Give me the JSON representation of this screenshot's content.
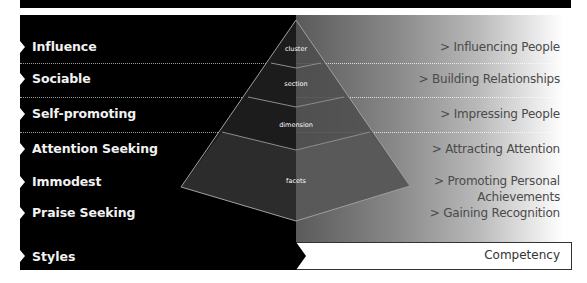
{
  "diagram": {
    "title_bar": "",
    "styles_header": "Styles",
    "competency_header": "Competency",
    "styles": [
      {
        "label": "Influence"
      },
      {
        "label": "Sociable"
      },
      {
        "label": "Self-promoting"
      },
      {
        "label": "Attention Seeking"
      },
      {
        "label": "Immodest"
      },
      {
        "label": "Praise Seeking"
      }
    ],
    "competencies": [
      {
        "line1": "> Influencing People",
        "line2": ""
      },
      {
        "line1": "> Building Relationships",
        "line2": ""
      },
      {
        "line1": "> Impressing People",
        "line2": ""
      },
      {
        "line1": "> Attracting Attention",
        "line2": ""
      },
      {
        "line1": "> Promoting Personal",
        "line2": "Achievements"
      },
      {
        "line1": "> Gaining Recognition",
        "line2": ""
      }
    ],
    "pyramid_levels": [
      "cluster",
      "section",
      "dimension",
      "facets"
    ],
    "colors": {
      "left_panel": "#000000",
      "pyramid_left_face": "#1a1a1a",
      "pyramid_right_face": "#555555",
      "pyramid_edge": "#9c9c9c",
      "competency_text": "#4a4a4a",
      "style_text": "#f2f2f2"
    }
  }
}
